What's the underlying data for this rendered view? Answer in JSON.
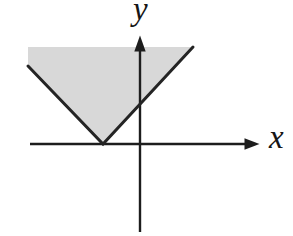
{
  "figure": {
    "kind": "math-graph",
    "axes": {
      "x_label": "x",
      "y_label": "y"
    },
    "colors": {
      "background": "#ffffff",
      "shading_fill": "#d8d8d8",
      "line_color": "#1d1d1d",
      "v_line_color": "#242424"
    },
    "geometry": {
      "region_points": "28,47 193,47 103,144 28,66",
      "v_boundary_points": "28,66 103,144 193,47",
      "x_axis_points": "30,144 246,144",
      "x_arrow_points": "244.5,138.3 259.5,144 244.5,149.7",
      "y_axis_points": "140,50 140,232",
      "y_arrow_points": "134.3,51.5 140,35.5 145.7,51.5"
    }
  }
}
